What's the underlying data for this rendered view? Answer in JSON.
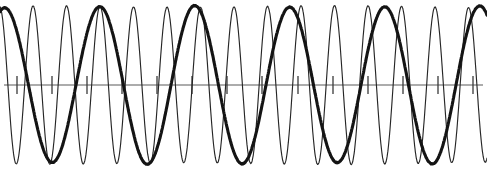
{
  "figure": {
    "caption": "",
    "width": 487,
    "height": 171,
    "background_color": "#ffffff",
    "ink_color": "#141414"
  },
  "chart_data": {
    "type": "line",
    "subtitle": "",
    "xlabel": "",
    "ylabel": "",
    "xlim": [
      0,
      487
    ],
    "ylim": [
      -1.15,
      1.15
    ],
    "grid": false,
    "legend": "none",
    "annotations": [],
    "axis": {
      "name": "horizontal-axis",
      "baseline_y": 85,
      "x_start": 4,
      "x_end": 483,
      "color": "#5b5b5b",
      "stroke_width": 1.1
    },
    "ticks": {
      "name": "axis-ticks",
      "count": 14,
      "first_x": 17,
      "spacing": 35.1,
      "half_height": 9,
      "color": "#3a3a3a",
      "x_positions": [
        17,
        52,
        87,
        122,
        157,
        192,
        227,
        262,
        298,
        333,
        368,
        403,
        438,
        473
      ],
      "tick_labels": []
    },
    "series": [
      {
        "name": "high-frequency-thin-wave",
        "style": "thin",
        "color": "#262626",
        "stroke_width": 1.15,
        "amplitude": 78,
        "period_px": 33.5,
        "cycles": 14.5,
        "phase_deg": 95,
        "baseline_y": 85,
        "samples": 1400
      },
      {
        "name": "low-frequency-thick-wave",
        "style": "thick",
        "color": "#141414",
        "stroke_width": 3.1,
        "amplitude": 78,
        "period_px": 95,
        "cycles": 5.1,
        "phase_deg": 72,
        "baseline_y": 85,
        "samples": 1400
      }
    ]
  }
}
